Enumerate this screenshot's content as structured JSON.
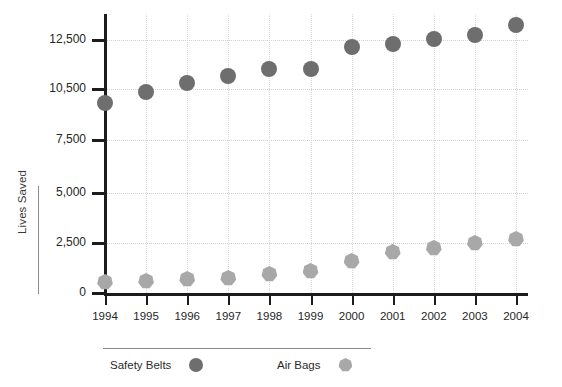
{
  "chart_data": {
    "type": "scatter",
    "title": "",
    "xlabel": "",
    "ylabel": "Lives Saved",
    "categories": [
      "1994",
      "1995",
      "1996",
      "1997",
      "1998",
      "1999",
      "2000",
      "2001",
      "2002",
      "2003",
      "2004"
    ],
    "series": [
      {
        "name": "Safety Belts",
        "marker": "circle",
        "color": "#6e6e6e",
        "values": [
          9700,
          10300,
          10750,
          11050,
          11300,
          11300,
          12200,
          12350,
          12550,
          12700,
          13100
        ]
      },
      {
        "name": "Air Bags",
        "marker": "heptagon",
        "color": "#a8a8a8",
        "values": [
          550,
          600,
          700,
          750,
          950,
          1100,
          1600,
          2050,
          2250,
          2500,
          2700
        ]
      }
    ],
    "ylim": [
      0,
      13500
    ],
    "ytick_labels": [
      "12,500",
      "10,500",
      "7,500",
      "5,000",
      "2,500",
      "0"
    ],
    "ytick_values": [
      12500,
      10500,
      7500,
      5000,
      2500,
      0
    ],
    "grid": true,
    "legend_position": "bottom"
  },
  "legend": {
    "items": [
      {
        "label": "Safety Belts",
        "marker": "circle-marker-icon"
      },
      {
        "label": "Air Bags",
        "marker": "heptagon-marker-icon"
      }
    ]
  }
}
